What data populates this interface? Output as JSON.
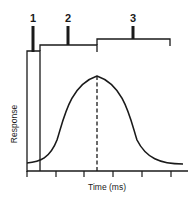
{
  "diagram": {
    "type": "response-time-curve",
    "markers": [
      {
        "id": "1",
        "label": "1"
      },
      {
        "id": "2",
        "label": "2"
      },
      {
        "id": "3",
        "label": "3"
      }
    ],
    "axes": {
      "xlabel": "Time (ms)",
      "ylabel": "Response",
      "x_tick_count": 6
    },
    "colors": {
      "ink": "#1a1a1a",
      "background": "#ffffff"
    }
  }
}
